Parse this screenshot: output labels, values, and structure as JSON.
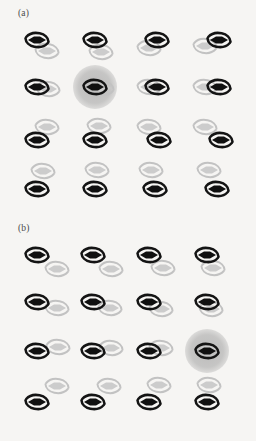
{
  "figure": {
    "background": "#f6f5f3",
    "width": 256,
    "height": 441,
    "caption_visible": false
  },
  "panels": [
    {
      "id": "a",
      "label": "(a)",
      "label_x": 18,
      "label_y": 8,
      "origin_y": 0,
      "rows": 4,
      "cols": 4,
      "col_x": [
        22,
        78,
        134,
        190
      ],
      "row_y": [
        28,
        73,
        118,
        163
      ],
      "highlight": {
        "row": 1,
        "col": 1,
        "color": "#9c9c9c"
      },
      "description": "partner unit rotates counterclockwise around the dark unit row by row",
      "cells": [
        [
          {
            "dark": {
              "x": 0,
              "y": 0
            },
            "pale": {
              "x": 10,
              "y": 11
            }
          },
          {
            "dark": {
              "x": 2,
              "y": 0
            },
            "pale": {
              "x": 8,
              "y": 12
            }
          },
          {
            "dark": {
              "x": 8,
              "y": 0
            },
            "pale": {
              "x": 0,
              "y": 8
            }
          },
          {
            "dark": {
              "x": 14,
              "y": 0
            },
            "pale": {
              "x": 0,
              "y": 6
            }
          }
        ],
        [
          {
            "dark": {
              "x": 0,
              "y": 2
            },
            "pale": {
              "x": 11,
              "y": 4
            }
          },
          {
            "dark": {
              "x": 2,
              "y": 2
            },
            "pale": {
              "x": 9,
              "y": 3
            }
          },
          {
            "dark": {
              "x": 8,
              "y": 2
            },
            "pale": {
              "x": 0,
              "y": 2
            }
          },
          {
            "dark": {
              "x": 14,
              "y": 2
            },
            "pale": {
              "x": 0,
              "y": 2
            }
          }
        ],
        [
          {
            "dark": {
              "x": 0,
              "y": 10
            },
            "pale": {
              "x": 10,
              "y": -3
            }
          },
          {
            "dark": {
              "x": 2,
              "y": 10
            },
            "pale": {
              "x": 6,
              "y": -4
            }
          },
          {
            "dark": {
              "x": 10,
              "y": 10
            },
            "pale": {
              "x": 0,
              "y": -3
            }
          },
          {
            "dark": {
              "x": 16,
              "y": 10
            },
            "pale": {
              "x": 0,
              "y": -3
            }
          }
        ],
        [
          {
            "dark": {
              "x": 0,
              "y": 14
            },
            "pale": {
              "x": 6,
              "y": -4
            }
          },
          {
            "dark": {
              "x": 2,
              "y": 14
            },
            "pale": {
              "x": 4,
              "y": -5
            }
          },
          {
            "dark": {
              "x": 6,
              "y": 14
            },
            "pale": {
              "x": 2,
              "y": -5
            }
          },
          {
            "dark": {
              "x": 12,
              "y": 14
            },
            "pale": {
              "x": 4,
              "y": -5
            }
          }
        ]
      ]
    },
    {
      "id": "b",
      "label": "(b)",
      "label_x": 18,
      "label_y": 8,
      "origin_y": 215,
      "rows": 4,
      "cols": 4,
      "col_x": [
        22,
        78,
        134,
        190
      ],
      "row_y": [
        28,
        73,
        118,
        163
      ],
      "highlight": {
        "row": 2,
        "col": 3,
        "color": "#9c9c9c"
      },
      "description": "pale partner separation shrinks from a wide down-right offset toward overlap",
      "cells": [
        [
          {
            "dark": {
              "x": 0,
              "y": 0
            },
            "pale": {
              "x": 20,
              "y": 14
            }
          },
          {
            "dark": {
              "x": 0,
              "y": 0
            },
            "pale": {
              "x": 18,
              "y": 14
            }
          },
          {
            "dark": {
              "x": 0,
              "y": 0
            },
            "pale": {
              "x": 14,
              "y": 13
            }
          },
          {
            "dark": {
              "x": 2,
              "y": 0
            },
            "pale": {
              "x": 8,
              "y": 13
            }
          }
        ],
        [
          {
            "dark": {
              "x": 0,
              "y": 2
            },
            "pale": {
              "x": 20,
              "y": 8
            }
          },
          {
            "dark": {
              "x": 0,
              "y": 2
            },
            "pale": {
              "x": 17,
              "y": 8
            }
          },
          {
            "dark": {
              "x": 0,
              "y": 2
            },
            "pale": {
              "x": 12,
              "y": 9
            }
          },
          {
            "dark": {
              "x": 2,
              "y": 2
            },
            "pale": {
              "x": 6,
              "y": 9
            }
          }
        ],
        [
          {
            "dark": {
              "x": 0,
              "y": 6
            },
            "pale": {
              "x": 21,
              "y": 2
            }
          },
          {
            "dark": {
              "x": 0,
              "y": 6
            },
            "pale": {
              "x": 18,
              "y": 3
            }
          },
          {
            "dark": {
              "x": 0,
              "y": 6
            },
            "pale": {
              "x": 12,
              "y": 3
            }
          },
          {
            "dark": {
              "x": 2,
              "y": 6
            },
            "pale": {
              "x": 4,
              "y": 3
            }
          }
        ],
        [
          {
            "dark": {
              "x": 0,
              "y": 12
            },
            "pale": {
              "x": 20,
              "y": -4
            }
          },
          {
            "dark": {
              "x": 0,
              "y": 12
            },
            "pale": {
              "x": 16,
              "y": -4
            }
          },
          {
            "dark": {
              "x": 0,
              "y": 12
            },
            "pale": {
              "x": 10,
              "y": -5
            }
          },
          {
            "dark": {
              "x": 2,
              "y": 12
            },
            "pale": {
              "x": 4,
              "y": -5
            }
          }
        ]
      ]
    }
  ],
  "glyph": {
    "name": "spiral-ring-with-lens",
    "dark_color": "#141414",
    "pale_color": "#c2c2c2",
    "lens_dark": "#101010",
    "lens_pale": "#cccccc",
    "stroke_width_dark": 2.6,
    "stroke_width_pale": 2.0
  }
}
